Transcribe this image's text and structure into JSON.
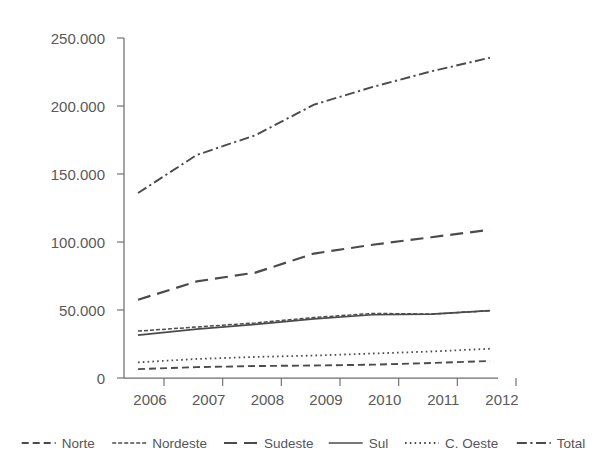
{
  "chart_data": {
    "type": "line",
    "title": "",
    "subtitle": "",
    "xlabel": "",
    "ylabel": "",
    "categories": [
      "2006",
      "2007",
      "2008",
      "2009",
      "2010",
      "2011",
      "2012"
    ],
    "x": [
      2006,
      2007,
      2008,
      2009,
      2010,
      2011,
      2012
    ],
    "xlim": [
      2006,
      2012
    ],
    "ylim": [
      0,
      250000
    ],
    "y_ticks": [
      0,
      50000,
      100000,
      150000,
      200000,
      250000
    ],
    "y_tick_labels": [
      "0",
      "50.000",
      "100.000",
      "150.000",
      "200.000",
      "250.000"
    ],
    "x_tick_labels": [
      "2006",
      "2007",
      "2008",
      "2009",
      "2010",
      "2011",
      "2012"
    ],
    "grid": false,
    "legend_position": "bottom",
    "number_format": "european-dot-thousands",
    "series": [
      {
        "name": "Norte",
        "style": "dashed",
        "dasharray": "7,4",
        "width": 1.9,
        "color": "#4b4b4d",
        "values": [
          6500,
          8000,
          8800,
          9200,
          9800,
          11000,
          12500
        ]
      },
      {
        "name": "Nordeste",
        "style": "fine-dash",
        "dasharray": "4,2",
        "width": 1.5,
        "color": "#4b4b4d",
        "values": [
          34500,
          37500,
          40500,
          44500,
          47500,
          47000,
          49500
        ]
      },
      {
        "name": "Sudeste",
        "style": "long-dash",
        "dasharray": "13,7",
        "width": 2.2,
        "color": "#4b4b4d",
        "values": [
          57500,
          71000,
          77500,
          91500,
          98000,
          103500,
          109000
        ]
      },
      {
        "name": "Sul",
        "style": "solid",
        "dasharray": "none",
        "width": 1.7,
        "color": "#4b4b4d",
        "values": [
          31500,
          36000,
          39500,
          43500,
          46500,
          47000,
          49500
        ]
      },
      {
        "name": "C. Oeste",
        "style": "dotted",
        "dasharray": "1.6,3.2",
        "width": 1.8,
        "color": "#4b4b4d",
        "values": [
          11500,
          14000,
          15500,
          16500,
          18000,
          19500,
          21500
        ]
      },
      {
        "name": "Total",
        "style": "dash-dot",
        "dasharray": "10,3.5,2.2,3.5",
        "width": 1.9,
        "color": "#4b4b4d",
        "values": [
          136000,
          164000,
          178500,
          201000,
          214000,
          225500,
          235500
        ]
      }
    ]
  },
  "legend": {
    "items": [
      {
        "label": "Norte",
        "dasharray": "7,4",
        "width": 1.9
      },
      {
        "label": "Nordeste",
        "dasharray": "4,2",
        "width": 1.5
      },
      {
        "label": "Sudeste",
        "dasharray": "13,7",
        "width": 2.2
      },
      {
        "label": "Sul",
        "dasharray": "none",
        "width": 1.7
      },
      {
        "label": "C. Oeste",
        "dasharray": "1.6,3.2",
        "width": 1.8
      },
      {
        "label": "Total",
        "dasharray": "10,3.5,2.2,3.5",
        "width": 1.9
      }
    ]
  },
  "colors": {
    "background": "#ffffff",
    "ink": "#4b4b4d",
    "axis": "#6d6d70",
    "label": "#59595b"
  }
}
